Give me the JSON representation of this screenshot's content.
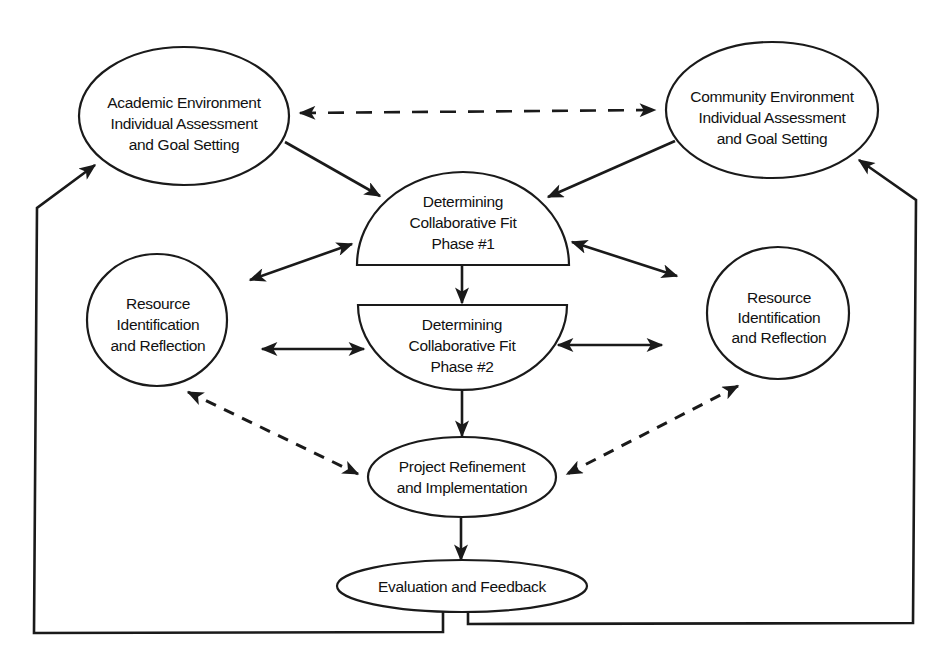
{
  "diagram": {
    "type": "flow-cycle",
    "colors": {
      "stroke": "#1a1a1a",
      "background": "#ffffff",
      "text": "#111111"
    },
    "nodes": {
      "academic": {
        "lines": [
          "Academic Environment",
          "Individual Assessment",
          "and Goal Setting"
        ],
        "shape": "ellipse"
      },
      "community": {
        "lines": [
          "Community Environment",
          "Individual Assessment",
          "and Goal Setting"
        ],
        "shape": "ellipse"
      },
      "phase1": {
        "lines": [
          "Determining",
          "Collaborative Fit",
          "Phase #1"
        ],
        "shape": "upper-half-ellipse"
      },
      "phase2": {
        "lines": [
          "Determining",
          "Collaborative Fit",
          "Phase #2"
        ],
        "shape": "lower-half-ellipse"
      },
      "resource_left": {
        "lines": [
          "Resource",
          "Identification",
          "and Reflection"
        ],
        "shape": "ellipse"
      },
      "resource_right": {
        "lines": [
          "Resource",
          "Identification",
          "and Reflection"
        ],
        "shape": "ellipse"
      },
      "project": {
        "lines": [
          "Project Refinement",
          "and Implementation"
        ],
        "shape": "ellipse"
      },
      "evaluation": {
        "lines": [
          "Evaluation and Feedback"
        ],
        "shape": "ellipse"
      }
    },
    "edges": [
      {
        "from": "academic",
        "to": "community",
        "style": "dashed",
        "direction": "both"
      },
      {
        "from": "academic",
        "to": "phase1",
        "style": "solid",
        "direction": "forward"
      },
      {
        "from": "community",
        "to": "phase1",
        "style": "solid",
        "direction": "forward"
      },
      {
        "from": "resource_left",
        "to": "phase1",
        "style": "solid",
        "direction": "both"
      },
      {
        "from": "resource_right",
        "to": "phase1",
        "style": "solid",
        "direction": "both"
      },
      {
        "from": "phase1",
        "to": "phase2",
        "style": "solid",
        "direction": "forward"
      },
      {
        "from": "resource_left",
        "to": "phase2",
        "style": "solid",
        "direction": "both"
      },
      {
        "from": "resource_right",
        "to": "phase2",
        "style": "solid",
        "direction": "both"
      },
      {
        "from": "phase2",
        "to": "project",
        "style": "solid",
        "direction": "forward"
      },
      {
        "from": "resource_left",
        "to": "project",
        "style": "dashed",
        "direction": "both"
      },
      {
        "from": "resource_right",
        "to": "project",
        "style": "dashed",
        "direction": "both"
      },
      {
        "from": "project",
        "to": "evaluation",
        "style": "solid",
        "direction": "forward"
      },
      {
        "from": "evaluation",
        "to": "academic",
        "style": "solid",
        "direction": "forward",
        "route": "feedback-loop-left"
      },
      {
        "from": "evaluation",
        "to": "community",
        "style": "solid",
        "direction": "forward",
        "route": "feedback-loop-right"
      }
    ]
  }
}
